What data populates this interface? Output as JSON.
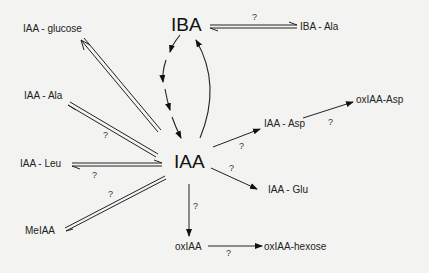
{
  "nodes": {
    "iba": "IBA",
    "iba_ala": "IBA - Ala",
    "iaa": "IAA",
    "iaa_glucose": "IAA - glucose",
    "iaa_ala": "IAA - Ala",
    "iaa_leu": "IAA - Leu",
    "meiaa": "MeIAA",
    "iaa_asp": "IAA - Asp",
    "oxiaa_asp": "oxIAA-Asp",
    "iaa_glu": "IAA - Glu",
    "oxiaa": "oxIAA",
    "oxiaa_hexose": "oxIAA-hexose"
  },
  "edge_labels": {
    "iba_ala": "?",
    "iaa_ala": "?",
    "iaa_leu": "?",
    "meiaa": "?",
    "iaa_asp": "?",
    "oxiaa_asp": "?",
    "iaa_glu": "?",
    "oxiaa": "?",
    "oxiaa_hexose": "?"
  }
}
